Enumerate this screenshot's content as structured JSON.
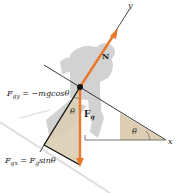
{
  "figure": {
    "colors": {
      "force_arrow": "#e8782a",
      "shade": "#dccdb3",
      "skier": "#cfcfcf",
      "axis": "#222222",
      "slope": "#d9d9d9"
    },
    "axes": {
      "x_label": "x",
      "y_label": "y"
    },
    "forces": {
      "normal": {
        "symbol": "N"
      },
      "gravity": {
        "symbol": "F",
        "subscript": "g"
      }
    },
    "angles": {
      "theta_left": "θ",
      "theta_right": "θ"
    },
    "equations": {
      "fgy": {
        "lhs": "F",
        "lhs_sub": "gy",
        "rhs": " = −mgcosθ"
      },
      "fgx": {
        "lhs": "F",
        "lhs_sub": "gx",
        "mid": " = F",
        "mid_sub": "g",
        "rhs": "sinθ"
      }
    }
  }
}
